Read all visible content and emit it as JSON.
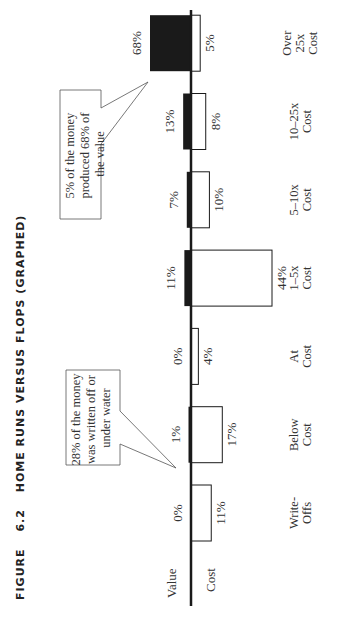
{
  "figure": {
    "label": "FIGURE",
    "number": "6.2",
    "title": "HOME RUNS VERSUS FLOPS (GRAPHED)"
  },
  "axis": {
    "value_label": "Value",
    "cost_label": "Cost"
  },
  "callouts": {
    "top": [
      "5% of the money",
      "produced 68% of",
      "the value"
    ],
    "bottom": [
      "28% of the money",
      "was written off or",
      "under water"
    ]
  },
  "colors": {
    "value_bar": "#1a1a1a",
    "cost_bar": "#ffffff",
    "outline": "#1a1a1a",
    "axis": "#1a1a1a"
  },
  "chart_data": {
    "type": "bar",
    "orientation": "diverging, rotated 90° counter-clockwise",
    "title": "Figure 6.2 Home Runs versus Flops (Graphed)",
    "categories": [
      "Write-Offs",
      "Below Cost",
      "At Cost",
      "1–5x Cost",
      "5–10x Cost",
      "10–25x Cost",
      "Over 25x Cost"
    ],
    "category_lines": [
      [
        "Write-",
        "Offs"
      ],
      [
        "Below",
        "Cost"
      ],
      [
        "At",
        "Cost"
      ],
      [
        "1–5x",
        "Cost"
      ],
      [
        "5–10x",
        "Cost"
      ],
      [
        "10–25x",
        "Cost"
      ],
      [
        "Over",
        "25x",
        "Cost"
      ]
    ],
    "series": [
      {
        "name": "Value",
        "values": [
          0,
          1,
          0,
          11,
          7,
          13,
          68
        ],
        "labels": [
          "0%",
          "1%",
          "0%",
          "11%",
          "7%",
          "13%",
          "68%"
        ],
        "fill": "black"
      },
      {
        "name": "Cost",
        "values": [
          11,
          17,
          4,
          44,
          10,
          8,
          5
        ],
        "labels": [
          "11%",
          "17%",
          "4%",
          "44%",
          "10%",
          "8%",
          "5%"
        ],
        "fill": "white"
      }
    ],
    "annotations": [
      "5% of the money produced 68% of the value",
      "28% of the money was written off or under water"
    ],
    "grid": false,
    "legend": "axis side labels: Value (above axis), Cost (below axis)"
  }
}
